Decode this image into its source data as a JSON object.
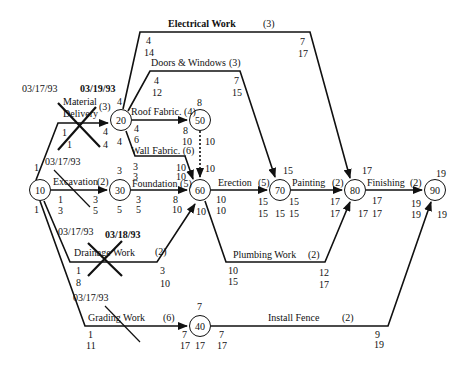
{
  "diagram": {
    "type": "activity-on-arrow network (CPM)",
    "nodes": [
      {
        "id": "10",
        "label": "10"
      },
      {
        "id": "20",
        "label": "20"
      },
      {
        "id": "30",
        "label": "30"
      },
      {
        "id": "40",
        "label": "40"
      },
      {
        "id": "50",
        "label": "50"
      },
      {
        "id": "60",
        "label": "60"
      },
      {
        "id": "70",
        "label": "70"
      },
      {
        "id": "80",
        "label": "80"
      },
      {
        "id": "90",
        "label": "90"
      }
    ],
    "activities": [
      {
        "name": "Material Delivery",
        "line1": "Material",
        "line2": "Delivery",
        "duration": "(3)",
        "from": "10",
        "to": "20",
        "start": "1",
        "start2": "1",
        "end": "4",
        "end2": "4",
        "crossed": true
      },
      {
        "name": "Excavation",
        "label": "Excavation",
        "duration": "(2)",
        "from": "10",
        "to": "30",
        "start": "1",
        "start2": "3",
        "end": "3",
        "end2": "5",
        "crossed": true
      },
      {
        "name": "Drainage Work",
        "label": "Drainage Work",
        "duration": "(2)",
        "from": "10",
        "to": "60",
        "start": "1",
        "start2": "8",
        "end": "3",
        "end2": "10",
        "crossed": true
      },
      {
        "name": "Grading Work",
        "label": "Grading Work",
        "duration": "(6)",
        "from": "10",
        "to": "40",
        "start": "1",
        "start2": "11",
        "end": "7",
        "end2": "17",
        "crossed": true
      },
      {
        "name": "Electrical Work",
        "label": "Electrical Work",
        "duration": "(3)",
        "from": "20",
        "to": "80",
        "start": "4",
        "start2": "14",
        "end": "7",
        "end2": "17"
      },
      {
        "name": "Doors & Windows",
        "label": "Doors & Windows",
        "duration": "(3)",
        "from": "20",
        "to": "70",
        "start": "4",
        "start2": "12",
        "end": "7",
        "end2": "15"
      },
      {
        "name": "Roof Fabric.",
        "label": "Roof Fabric. (4)",
        "duration": "(4)",
        "from": "20",
        "to": "50",
        "start": "4",
        "start2": "4",
        "end": "8",
        "end2": "8"
      },
      {
        "name": "Wall Fabric.",
        "label": "Wall Fabric. (6)",
        "duration": "(6)",
        "from": "20",
        "to": "60",
        "start": "4",
        "start2": "6",
        "end": "10",
        "end2": "10"
      },
      {
        "name": "Foundation",
        "label": "Foundation (5)",
        "duration": "(5)",
        "from": "30",
        "to": "60",
        "start": "3",
        "start2": "5",
        "end": "8",
        "end2": "10"
      },
      {
        "name": "Dummy",
        "from": "50",
        "to": "60",
        "dashed": true
      },
      {
        "name": "Erection",
        "label": "Erection",
        "duration": "(5)",
        "from": "60",
        "to": "70",
        "start": "10",
        "start2": "10",
        "end": "15",
        "end2": "15"
      },
      {
        "name": "Plumbing Work",
        "label": "Plumbing Work",
        "duration": "(2)",
        "from": "60",
        "to": "80",
        "start": "10",
        "start2": "15",
        "end": "12",
        "end2": "17"
      },
      {
        "name": "Painting",
        "label": "Painting",
        "duration": "(2)",
        "from": "70",
        "to": "80",
        "start": "15",
        "start2": "15",
        "end": "17",
        "end2": "17"
      },
      {
        "name": "Finishing",
        "label": "Finishing",
        "duration": "(2)",
        "from": "80",
        "to": "90",
        "start": "17",
        "start2": "17",
        "end": "19",
        "end2": "19"
      },
      {
        "name": "Install Fence",
        "label": "Install Fence",
        "duration": "(2)",
        "from": "40",
        "to": "90",
        "start": "7",
        "start2": "17",
        "end": "9",
        "end2": "19"
      }
    ],
    "node_times": {
      "10": {
        "above": "1",
        "below": "1"
      },
      "20": {
        "left_upper": "4",
        "left_lower": "4",
        "right": "4"
      },
      "30": {
        "above": "3",
        "below": "5"
      },
      "40": {
        "above": "7",
        "below": "17"
      },
      "50": {
        "above": "8",
        "right": "10"
      },
      "60": {
        "above_right": "10",
        "below": "10"
      },
      "70": {
        "above": "15",
        "below": "15"
      },
      "80": {
        "above": "17",
        "below": "17"
      },
      "90": {
        "above": "19",
        "below": "19"
      }
    },
    "dates": {
      "material": "03/17/93",
      "material_done": "03/19/93",
      "excavation": "03/17/93",
      "drainage": "03/17/93",
      "drainage_done": "03/18/93",
      "grading": "03/17/93"
    }
  }
}
